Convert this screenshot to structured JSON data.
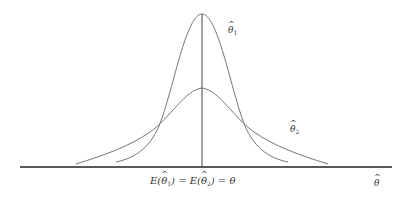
{
  "diagram": {
    "type": "sampling-distributions-comparison",
    "curves": [
      {
        "id": "theta1",
        "label_symbol": "θ",
        "label_subscript": "1",
        "shape": "narrow-tall",
        "peak_x": 202,
        "peak_y": 14
      },
      {
        "id": "theta2",
        "label_symbol": "θ",
        "label_subscript": "2",
        "shape": "wide-short",
        "peak_x": 202,
        "peak_y": 88
      }
    ],
    "axis": {
      "x_label_symbol": "θ",
      "center_label": {
        "part1": "E(",
        "sym1": "θ",
        "sub1": "1",
        "part2": ") = E(",
        "sym2": "θ",
        "sub2": "2",
        "part3": ") = θ"
      }
    },
    "colors": {
      "curve": "#666666",
      "axis": "#222222",
      "center_line": "#444444",
      "background": "#ffffff"
    }
  }
}
